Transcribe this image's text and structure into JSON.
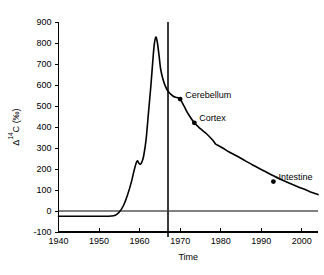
{
  "chart_data": {
    "type": "line",
    "title": "",
    "xlabel": "Time",
    "ylabel": "Δ¹⁴C (‰)",
    "ylabel_parts": {
      "delta": "Δ",
      "superscript": "14",
      "element": "C",
      "units": "(‰)"
    },
    "xlim": [
      1940,
      2004
    ],
    "ylim": [
      -100,
      900
    ],
    "xticks": [
      1940,
      1950,
      1960,
      1970,
      1980,
      1990,
      2000
    ],
    "xtick_labels": [
      "1940",
      "1950",
      "1960",
      "1970",
      "1980",
      "1990",
      "2000"
    ],
    "yticks": [
      -100,
      0,
      100,
      200,
      300,
      400,
      500,
      600,
      700,
      800,
      900
    ],
    "ytick_labels": [
      "-100",
      "0",
      "100",
      "200",
      "300",
      "400",
      "500",
      "600",
      "700",
      "800",
      "900"
    ],
    "grid": false,
    "legend": "none",
    "series": [
      {
        "name": "Atmospheric Δ14C",
        "color": "#000000",
        "x": [
          1940,
          1944,
          1948,
          1951,
          1953,
          1954,
          1955,
          1956,
          1957,
          1958,
          1958.8,
          1959.4,
          1959.8,
          1960.2,
          1960.6,
          1961,
          1961.6,
          1962.2,
          1962.8,
          1963.2,
          1963.6,
          1964,
          1964.4,
          1964.8,
          1965.2,
          1965.8,
          1966.4,
          1967,
          1967.6,
          1968.4,
          1969.2,
          1970,
          1971,
          1972,
          1973.5,
          1975,
          1976.5,
          1978,
          1978.8,
          1979.4,
          1980.5,
          1982,
          1984,
          1986,
          1988,
          1990,
          1993,
          1996,
          1999,
          2002,
          2004
        ],
        "y": [
          -25,
          -25,
          -25,
          -25,
          -24,
          -20,
          -5,
          25,
          75,
          140,
          205,
          238,
          228,
          222,
          235,
          262,
          340,
          470,
          600,
          700,
          790,
          828,
          800,
          740,
          675,
          625,
          592,
          570,
          558,
          545,
          540,
          533,
          498,
          462,
          420,
          392,
          368,
          338,
          318,
          312,
          300,
          282,
          262,
          240,
          218,
          198,
          168,
          140,
          116,
          92,
          78
        ]
      }
    ],
    "markers": [
      {
        "label": "Cerebellum",
        "x": 1970,
        "y": 533
      },
      {
        "label": "Cortex",
        "x": 1973.5,
        "y": 420
      },
      {
        "label": "Intestine",
        "x": 1993,
        "y": 140
      }
    ],
    "reference_lines": [
      {
        "orientation": "vertical",
        "x": 1967,
        "color": "#3a3a3a"
      },
      {
        "orientation": "horizontal",
        "y": 0,
        "color": "#808080"
      }
    ]
  }
}
